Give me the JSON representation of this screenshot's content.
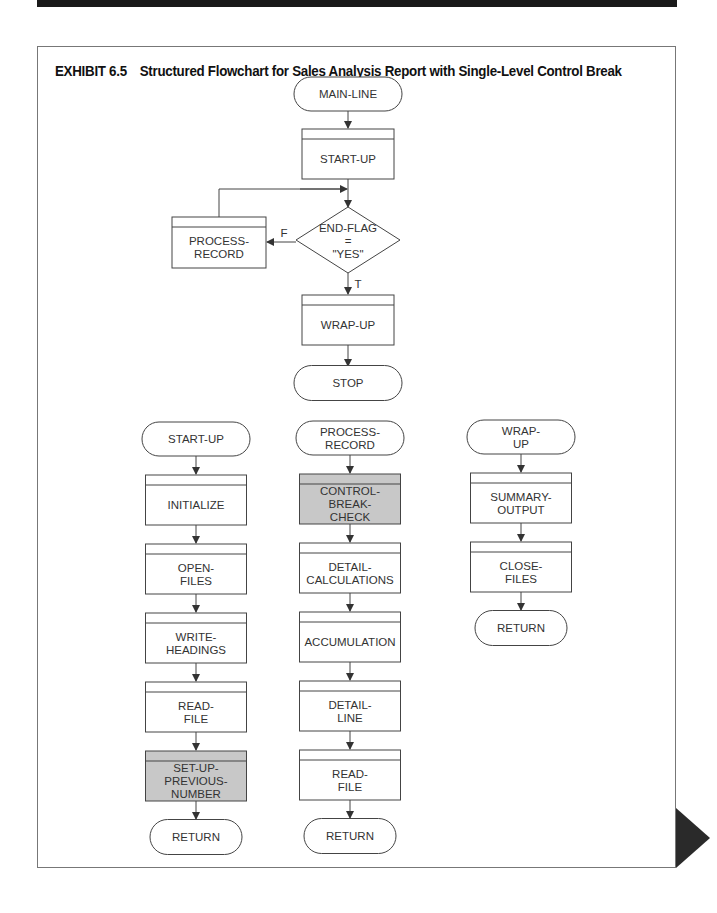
{
  "banner": {
    "label": "APPLICATION 6A"
  },
  "exhibit": {
    "number": "EXHIBIT 6.5",
    "title": "Structured Flowchart for Sales Analysis Report with Single-Level Control Break"
  },
  "colors": {
    "shaded_box": "#c8c8c8",
    "line": "#444444"
  },
  "main": {
    "start": "MAIN-LINE",
    "startup": "START-UP",
    "decision": [
      "END-FLAG",
      "=",
      "\"YES\""
    ],
    "false_label": "F",
    "true_label": "T",
    "process": [
      "PROCESS-",
      "RECORD"
    ],
    "wrapup": "WRAP-UP",
    "stop": "STOP"
  },
  "startup_module": {
    "terminal": "START-UP",
    "steps": [
      [
        "INITIALIZE"
      ],
      [
        "OPEN-",
        "FILES"
      ],
      [
        "WRITE-",
        "HEADINGS"
      ],
      [
        "READ-",
        "FILE"
      ],
      [
        "SET-UP-",
        "PREVIOUS-",
        "NUMBER"
      ]
    ],
    "shaded": [
      false,
      false,
      false,
      false,
      true
    ],
    "end": "RETURN"
  },
  "process_module": {
    "terminal": [
      "PROCESS-",
      "RECORD"
    ],
    "steps": [
      [
        "CONTROL-",
        "BREAK-",
        "CHECK"
      ],
      [
        "DETAIL-",
        "CALCULATIONS"
      ],
      [
        "ACCUMULATION"
      ],
      [
        "DETAIL-",
        "LINE"
      ],
      [
        "READ-",
        "FILE"
      ]
    ],
    "shaded": [
      true,
      false,
      false,
      false,
      false
    ],
    "end": "RETURN"
  },
  "wrapup_module": {
    "terminal": [
      "WRAP-",
      "UP"
    ],
    "steps": [
      [
        "SUMMARY-",
        "OUTPUT"
      ],
      [
        "CLOSE-",
        "FILES"
      ]
    ],
    "shaded": [
      false,
      false
    ],
    "end": "RETURN"
  }
}
